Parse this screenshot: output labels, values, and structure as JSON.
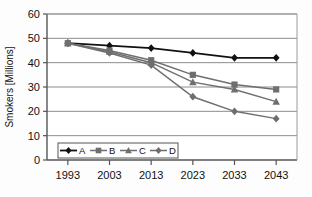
{
  "chart_data": {
    "type": "line",
    "title": "",
    "subtitle": "",
    "xlabel": "",
    "ylabel": "Smokers [Millions]",
    "x": [
      1993,
      2003,
      2013,
      2023,
      2033,
      2043
    ],
    "xtick_labels": [
      "1993",
      "2003",
      "2013",
      "2023",
      "2033",
      "2043"
    ],
    "ytick_labels": [
      "0",
      "10",
      "20",
      "30",
      "40",
      "50",
      "60"
    ],
    "yticks": [
      0,
      10,
      20,
      30,
      40,
      50,
      60
    ],
    "xlim": [
      1988,
      2048
    ],
    "ylim": [
      0,
      60
    ],
    "grid": "horizontal",
    "legend_position": "inside-bottom-left",
    "series": [
      {
        "name": "A",
        "marker": "diamond",
        "color": "#111111",
        "values": [
          48,
          47,
          46,
          44,
          42,
          42
        ]
      },
      {
        "name": "B",
        "marker": "square",
        "color": "#6e6e6e",
        "values": [
          48,
          45,
          41,
          35,
          31,
          29
        ]
      },
      {
        "name": "C",
        "marker": "triangle",
        "color": "#6e6e6e",
        "values": [
          48,
          44.5,
          40,
          32,
          29,
          24
        ]
      },
      {
        "name": "D",
        "marker": "diamond",
        "color": "#6e6e6e",
        "values": [
          48,
          44,
          39,
          26,
          20,
          17
        ]
      }
    ]
  },
  "legend": {
    "entries": [
      {
        "label": "A"
      },
      {
        "label": "B"
      },
      {
        "label": "C"
      },
      {
        "label": "D"
      }
    ]
  },
  "colors": {
    "series_a": "#111111",
    "series_bcd": "#6e6e6e",
    "axis": "#555555",
    "gridline": "#808080",
    "plot_background": "#ffffff"
  }
}
